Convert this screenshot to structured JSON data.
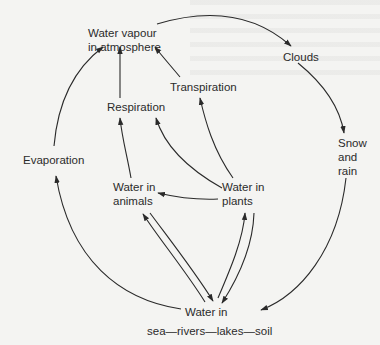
{
  "diagram": {
    "nodes": {
      "vapour": {
        "line1": "Water vapour",
        "line2": "in atmosphere"
      },
      "clouds": {
        "label": "Clouds"
      },
      "snow_rain": {
        "line1": "Snow",
        "line2": "and",
        "line3": "rain"
      },
      "transpiration": {
        "label": "Transpiration"
      },
      "respiration": {
        "label": "Respiration"
      },
      "evaporation": {
        "label": "Evaporation"
      },
      "animals": {
        "line1": "Water in",
        "line2": "animals"
      },
      "plants": {
        "line1": "Water in",
        "line2": "plants"
      },
      "sea": {
        "line1": "Water in",
        "line2": "sea—rivers—lakes—soil"
      }
    },
    "edges": [
      {
        "from": "vapour",
        "to": "clouds"
      },
      {
        "from": "clouds",
        "to": "snow_rain"
      },
      {
        "from": "snow_rain",
        "to": "sea"
      },
      {
        "from": "sea",
        "to": "evaporation"
      },
      {
        "from": "evaporation",
        "to": "vapour"
      },
      {
        "from": "respiration",
        "to": "vapour"
      },
      {
        "from": "transpiration",
        "to": "vapour"
      },
      {
        "from": "animals",
        "to": "respiration"
      },
      {
        "from": "plants",
        "to": "respiration"
      },
      {
        "from": "plants",
        "to": "transpiration"
      },
      {
        "from": "plants",
        "to": "animals"
      },
      {
        "from": "sea",
        "to": "animals"
      },
      {
        "from": "animals",
        "to": "sea"
      },
      {
        "from": "sea",
        "to": "plants"
      },
      {
        "from": "plants",
        "to": "sea"
      }
    ],
    "colors": {
      "line": "#2a2a2a",
      "background": "#f4f4f2"
    }
  }
}
